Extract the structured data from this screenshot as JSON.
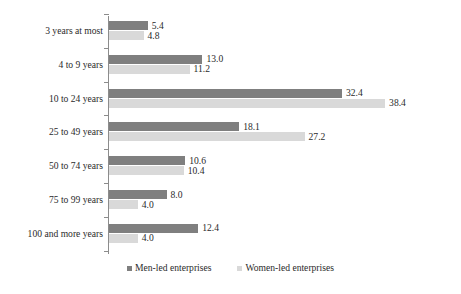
{
  "chart_data": {
    "type": "bar",
    "orientation": "horizontal",
    "title": "",
    "subtitle": "",
    "xlabel": "",
    "ylabel": "",
    "grid": false,
    "axis_visible": true,
    "xlim": [
      0,
      38.4
    ],
    "value_format": "one-decimal",
    "categories": [
      "3 years at most",
      "4 to 9 years",
      "10 to 24 years",
      "25 to 49 years",
      "50 to 74 years",
      "75 to 99 years",
      "100 and more years"
    ],
    "series": [
      {
        "name": "Men-led enterprises",
        "color": "#7f7f7f",
        "values": [
          5.4,
          13.0,
          32.4,
          18.1,
          10.6,
          8.0,
          12.4
        ],
        "labels": [
          "5.4",
          "13.0",
          "32.4",
          "18.1",
          "10.6",
          "8.0",
          "12.4"
        ]
      },
      {
        "name": "Women-led enterprises",
        "color": "#d9d9d9",
        "values": [
          4.8,
          11.2,
          38.4,
          27.2,
          10.4,
          4.0,
          4.0
        ],
        "labels": [
          "4.8",
          "11.2",
          "38.4",
          "27.2",
          "10.4",
          "4.0",
          "4.0"
        ]
      }
    ],
    "legend": {
      "position": "bottom",
      "entries": [
        {
          "label": "Men-led enterprises",
          "color": "#7f7f7f",
          "marker": "square-swatch-icon"
        },
        {
          "label": "Women-led enterprises",
          "color": "#d9d9d9",
          "marker": "square-swatch-icon"
        }
      ]
    }
  }
}
